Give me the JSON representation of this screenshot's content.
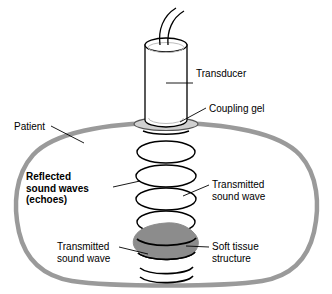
{
  "figure": {
    "labels": {
      "transducer": "Transducer",
      "coupling_gel": "Coupling gel",
      "patient": "Patient",
      "reflected_waves": "Reflected\nsound waves\n(echoes)",
      "transmitted_wave_right": "Transmitted\nsound wave",
      "soft_tissue": "Soft tissue\nstructure",
      "transmitted_wave_left": "Transmitted\nsound wave"
    },
    "colors": {
      "outline": "#000000",
      "body_outline": "#9a9a9a",
      "gel_fill": "#d0d0d0",
      "soft_tissue_fill": "#8c8c8c",
      "background": "#ffffff",
      "text": "#000000"
    },
    "parts": [
      "cable",
      "transducer-cylinder",
      "coupling-gel",
      "patient-body-outline",
      "sound-wave-arcs",
      "soft-tissue-structure"
    ],
    "wave_arc_count": 9
  }
}
